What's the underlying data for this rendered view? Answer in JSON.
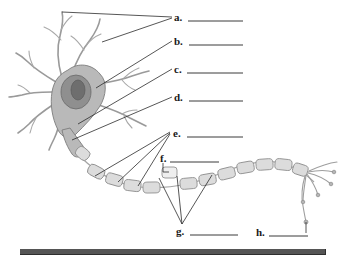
{
  "worksheet": {
    "title": "Neuron Structure Labeling Diagram",
    "subject": "neuron-anatomy",
    "instruction_visible": false,
    "ink_color": "#2b2b2b",
    "drawing_color": "#9a9a9a"
  },
  "labels": [
    {
      "key": "a",
      "text": "a.",
      "answer_value": "",
      "answer_placeholder": ""
    },
    {
      "key": "b",
      "text": "b.",
      "answer_value": "",
      "answer_placeholder": ""
    },
    {
      "key": "c",
      "text": "c.",
      "answer_value": "",
      "answer_placeholder": ""
    },
    {
      "key": "d",
      "text": "d.",
      "answer_value": "",
      "answer_placeholder": ""
    },
    {
      "key": "e",
      "text": "e.",
      "answer_value": "",
      "answer_placeholder": ""
    },
    {
      "key": "f",
      "text": "f.",
      "answer_value": "",
      "answer_placeholder": ""
    },
    {
      "key": "g",
      "text": "g.",
      "answer_value": "",
      "answer_placeholder": ""
    },
    {
      "key": "h",
      "text": "h.",
      "answer_value": "",
      "answer_placeholder": ""
    }
  ],
  "diagram": {
    "name": "neuron-illustration",
    "parts": [
      "dendrites",
      "cell-body-soma",
      "nucleus",
      "axon-hillock",
      "axon",
      "node-of-ranvier",
      "myelin-sheath",
      "axon-terminals"
    ]
  },
  "footer": {
    "bar_name": "bottom-rule",
    "bar_color": "#555555"
  }
}
